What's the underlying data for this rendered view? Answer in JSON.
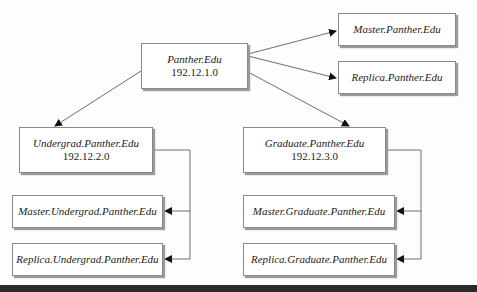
{
  "diagram": {
    "type": "DNS domain hierarchy",
    "root": {
      "name": "Panther.Edu",
      "ip": "192.12.1.0"
    },
    "root_servers": [
      {
        "name": "Master.Panther.Edu"
      },
      {
        "name": "Replica.Panther.Edu"
      }
    ],
    "subdomains": [
      {
        "name": "Undergrad.Panther.Edu",
        "ip": "192.12.2.0",
        "servers": [
          {
            "name": "Master.Undergrad.Panther.Edu"
          },
          {
            "name": "Replica.Undergrad.Panther.Edu"
          }
        ]
      },
      {
        "name": "Graduate.Panther.Edu",
        "ip": "192.12.3.0",
        "servers": [
          {
            "name": "Master.Graduate.Panther.Edu"
          },
          {
            "name": "Replica.Graduate.Panther.Edu"
          }
        ]
      }
    ],
    "colors": {
      "line": "#6e6e6e",
      "arrow": "#111111",
      "box_border": "#8a8a8a",
      "box_fill": "#ffffff",
      "bottom_band": "#2a2a2a"
    }
  }
}
